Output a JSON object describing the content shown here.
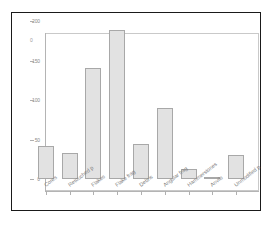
{
  "chart_data": {
    "type": "bar",
    "title": "",
    "subtitle": "",
    "xlabel": "",
    "ylabel": "",
    "ylim": [
      0,
      200
    ],
    "yticks": [
      0,
      50,
      100,
      150,
      200
    ],
    "ytick_labels": [
      "0",
      "50",
      "100",
      "150",
      "200"
    ],
    "extra_top_label": "0",
    "grid": false,
    "legend": "none",
    "categories": [
      "Cores",
      "Retouched p",
      "Flakes",
      "Flake frag",
      "Debris",
      "Angular frag",
      "Hammerstones",
      "Anvils",
      "Unmodified p"
    ],
    "values": [
      42,
      33,
      141,
      188,
      44,
      90,
      13,
      2,
      31
    ],
    "bar_fill": "#e2e2e2",
    "bar_edge": "#a8a8a8",
    "axis_color": "#b0b0b0",
    "tick_label_color": "#8a8a8a",
    "frame_color": "#1a1a1a",
    "plot_box_color": "#c9c9c9",
    "background": "#ffffff"
  }
}
